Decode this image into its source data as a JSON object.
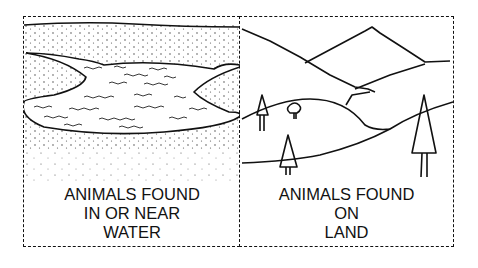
{
  "panels": [
    {
      "id": "water",
      "scene": "pond surrounded by sandy shore",
      "label_lines": [
        "ANIMALS FOUND",
        "IN OR NEAR",
        "WATER"
      ]
    },
    {
      "id": "land",
      "scene": "mountains, hills and trees",
      "label_lines": [
        "ANIMALS FOUND",
        "ON",
        "LAND"
      ]
    }
  ]
}
